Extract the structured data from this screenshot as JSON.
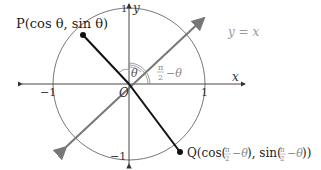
{
  "diagram": {
    "axes": {
      "x_label": "x",
      "y_label": "y",
      "x_tick_pos": "1",
      "x_tick_neg": "−1",
      "y_tick_pos": "1",
      "y_tick_neg": "−1",
      "origin_label": "O"
    },
    "line_label": "y = x",
    "point_p": {
      "name": "P",
      "label": "P(cos θ, sin θ)"
    },
    "point_q": {
      "name": "Q",
      "label_prefix": "Q(cos(",
      "label_mid": "), sin(",
      "label_suffix": "))",
      "angle_expr": "π/2 − θ"
    },
    "angle_theta": "θ",
    "angle_complement_num": "π",
    "angle_complement_den": "2",
    "angle_complement_rest": "−θ",
    "colors": {
      "axis": "#333333",
      "circle": "#555555",
      "diagonal": "#777777",
      "radius": "#111111",
      "label_gray": "#888888"
    }
  }
}
